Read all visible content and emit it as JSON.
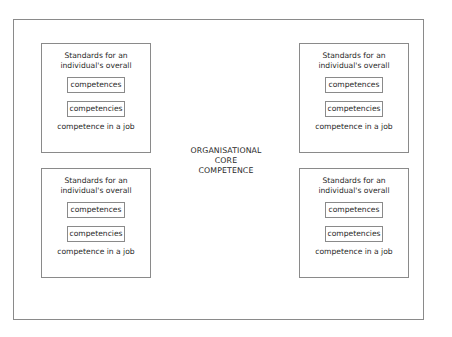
{
  "diagram": {
    "center_label": {
      "lines": [
        "ORGANISATIONAL",
        "CORE",
        "COMPETENCE"
      ]
    },
    "boxes": [
      {
        "position": "top-left",
        "title_lines": [
          "Standards for an",
          "individual's overall"
        ],
        "inner_items": [
          "competences",
          "competencies"
        ],
        "footer": "competence in a job"
      },
      {
        "position": "top-right",
        "title_lines": [
          "Standards for an",
          "individual's overall"
        ],
        "inner_items": [
          "competences",
          "competencies"
        ],
        "footer": "competence in a job"
      },
      {
        "position": "bottom-left",
        "title_lines": [
          "Standards for an",
          "individual's overall"
        ],
        "inner_items": [
          "competences",
          "competencies"
        ],
        "footer": "competence in a job"
      },
      {
        "position": "bottom-right",
        "title_lines": [
          "Standards for an",
          "individual's overall"
        ],
        "inner_items": [
          "competences",
          "competencies"
        ],
        "footer": "competence in a job"
      }
    ],
    "colors": {
      "border": "#8a8a8a",
      "text": "#2a2a2a",
      "background": "#ffffff"
    }
  }
}
